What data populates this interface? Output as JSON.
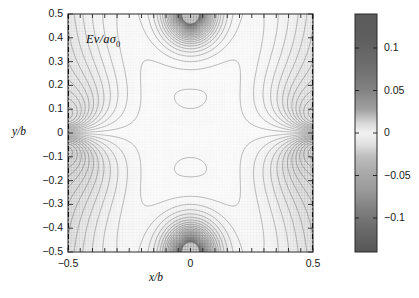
{
  "figure": {
    "type": "contour-plot",
    "annotation": {
      "text_main": "Ev/a",
      "text_sigma": "σ",
      "text_sub": "0",
      "full": "Ev/aσ₀"
    },
    "axes": {
      "x": {
        "label": "x/b",
        "min": -0.5,
        "max": 0.5,
        "ticks": [
          -0.5,
          0,
          0.5
        ],
        "tick_labels": [
          "−0.5",
          "0",
          "0.5"
        ],
        "minor_tick_step": 0.05
      },
      "y": {
        "label": "y/b",
        "min": -0.5,
        "max": 0.5,
        "ticks": [
          -0.5,
          -0.4,
          -0.3,
          -0.2,
          -0.1,
          0,
          0.1,
          0.2,
          0.3,
          0.4,
          0.5
        ],
        "tick_labels": [
          "−0.5",
          "−0.4",
          "−0.3",
          "−0.2",
          "−0.1",
          "0",
          "0.1",
          "0.2",
          "0.3",
          "0.4",
          "0.5"
        ]
      }
    },
    "colorbar": {
      "orientation": "vertical",
      "min": -0.14,
      "max": 0.14,
      "ticks": [
        0.1,
        0.05,
        0,
        -0.05,
        -0.1
      ],
      "tick_labels": [
        "0.1",
        "0.05",
        "0",
        "−0.05",
        "−0.1"
      ],
      "colormap": "gray-nonmonotonic",
      "stops": [
        {
          "pos": 0.0,
          "color": "#5b5b5b"
        },
        {
          "pos": 0.1,
          "color": "#5e5e5e"
        },
        {
          "pos": 0.22,
          "color": "#6e6e6e"
        },
        {
          "pos": 0.32,
          "color": "#828282"
        },
        {
          "pos": 0.4,
          "color": "#a0a0a0"
        },
        {
          "pos": 0.46,
          "color": "#d8d8d8"
        },
        {
          "pos": 0.5,
          "color": "#f2f2f2"
        },
        {
          "pos": 0.545,
          "color": "#e2e2e2"
        },
        {
          "pos": 0.6,
          "color": "#bdbdbd"
        },
        {
          "pos": 0.67,
          "color": "#a8a8a8"
        },
        {
          "pos": 0.74,
          "color": "#9a9a9a"
        },
        {
          "pos": 0.82,
          "color": "#808080"
        },
        {
          "pos": 0.9,
          "color": "#6a6a6a"
        },
        {
          "pos": 1.0,
          "color": "#575757"
        }
      ]
    },
    "boundaries": {
      "left_edge_style": "dash-dot",
      "right_edge_style": "dash-dot",
      "top_edge_style": "solid",
      "bottom_edge_style": "solid"
    },
    "chart_data": {
      "type": "contour",
      "title": "",
      "xlabel": "x/b",
      "ylabel": "y/b",
      "xlim": [
        -0.5,
        0.5
      ],
      "ylim": [
        -0.5,
        0.5
      ],
      "clim": [
        -0.14,
        0.14
      ],
      "quantity": "Ev/aσ₀",
      "grid": false,
      "legend": "none",
      "colorbar_ticks": [
        0.1,
        0.05,
        0,
        -0.05,
        -0.1
      ],
      "contour_count": 60,
      "features": [
        "saddle point near x=-0.45, y=0",
        "saddle point near x=0.45, y=0",
        "nested arcs centered at x=0 near y=-0.5",
        "nested arcs centered at x=0 near y=+0.5",
        "dense banding along left and right edges",
        "near-zero light band along y=0 mid-region"
      ]
    }
  }
}
